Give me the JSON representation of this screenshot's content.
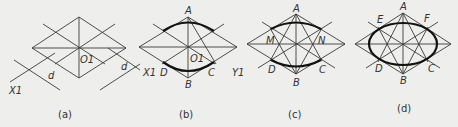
{
  "figure": {
    "panels": [
      {
        "caption": "(a)",
        "labels": {
          "center": "O1",
          "x_axis": "X1",
          "y_axis": "Y1",
          "dim1": "d",
          "dim2": "d"
        }
      },
      {
        "caption": "(b)",
        "labels": {
          "top": "A",
          "bottom": "B",
          "right_lower": "C",
          "left_lower": "D",
          "center": "O1",
          "x_axis": "X1",
          "y_axis": "Y1"
        }
      },
      {
        "caption": "(c)",
        "labels": {
          "top": "A",
          "bottom": "B",
          "right_lower": "C",
          "left_lower": "D",
          "left_mid": "M",
          "right_mid": "N"
        }
      },
      {
        "caption": "(d)",
        "labels": {
          "top": "A",
          "bottom": "B",
          "right_lower": "C",
          "left_lower": "D",
          "left_upper": "E",
          "right_upper": "F"
        }
      }
    ]
  }
}
